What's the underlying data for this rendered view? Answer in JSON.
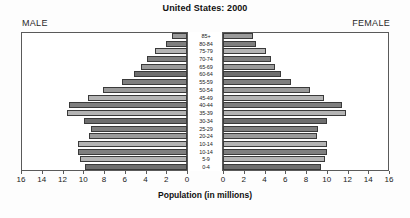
{
  "chart_data": {
    "type": "bar",
    "subtype": "population-pyramid",
    "title": "United States: 2000",
    "xlabel": "Population (in millions)",
    "ylabel": "",
    "xlim": [
      0,
      16
    ],
    "grid": false,
    "legend_position": "top-corners",
    "left_panel_label": "MALE",
    "right_panel_label": "FEMALE",
    "xticks": [
      0,
      2,
      4,
      6,
      8,
      10,
      12,
      14,
      16
    ],
    "left_tick_labels": [
      "16",
      "14",
      "12",
      "10",
      "8",
      "6",
      "4",
      "2",
      "0"
    ],
    "right_tick_labels": [
      "0",
      "2",
      "4",
      "6",
      "8",
      "10",
      "12",
      "14",
      "16"
    ],
    "categories": [
      "85+",
      "80-84",
      "75-79",
      "70-74",
      "65-69",
      "60-64",
      "55-59",
      "50-54",
      "45-49",
      "40-44",
      "35-39",
      "30-34",
      "25-29",
      "20-24",
      "10-14",
      "10-14",
      "5-9",
      "0-4"
    ],
    "series": [
      {
        "name": "MALE",
        "values": [
          1.4,
          2.0,
          3.1,
          3.9,
          4.4,
          5.1,
          6.3,
          8.1,
          9.5,
          11.4,
          11.6,
          9.9,
          9.3,
          9.4,
          10.5,
          10.5,
          10.3,
          9.8
        ]
      },
      {
        "name": "FEMALE",
        "values": [
          2.9,
          3.2,
          4.1,
          4.6,
          5.0,
          5.6,
          6.6,
          8.4,
          9.7,
          11.5,
          11.9,
          10.0,
          9.2,
          9.1,
          10.0,
          10.0,
          9.8,
          9.4
        ]
      }
    ]
  },
  "chart": {
    "title": "United States: 2000",
    "male_label": "MALE",
    "female_label": "FEMALE",
    "x_axis_title": "Population (in millions)"
  }
}
